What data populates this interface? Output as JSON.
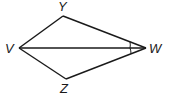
{
  "diagram": {
    "type": "geometry-kite",
    "points": {
      "Y": {
        "label": "Y",
        "x": 63,
        "y": 16
      },
      "V": {
        "label": "V",
        "x": 19,
        "y": 48
      },
      "W": {
        "label": "W",
        "x": 146,
        "y": 48
      },
      "Z": {
        "label": "Z",
        "x": 66,
        "y": 79
      }
    },
    "segments": [
      "VY",
      "YW",
      "VZ",
      "ZW",
      "VW"
    ],
    "angle_marks": [
      "YWV",
      "VWZ"
    ],
    "colors": {
      "stroke": "#1a1a1a",
      "background": "#ffffff"
    }
  }
}
